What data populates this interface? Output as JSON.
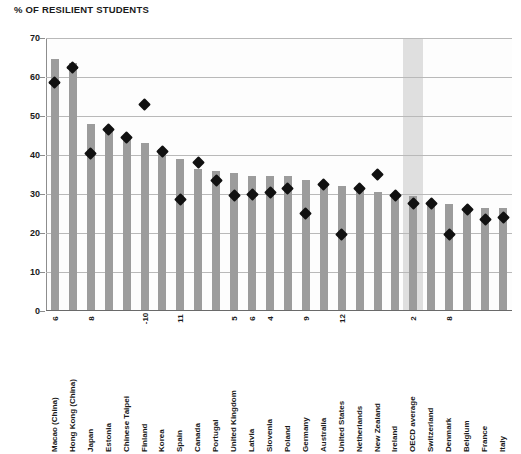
{
  "chart_data": {
    "type": "bar",
    "title": "% OF RESILIENT STUDENTS",
    "xlabel": "",
    "ylabel": "",
    "ylim": [
      0,
      70
    ],
    "ytick_step": 10,
    "yticks": [
      0,
      10,
      20,
      30,
      40,
      50,
      60,
      70
    ],
    "grid": true,
    "legend": "none",
    "highlight_category": "OECD average",
    "categories": [
      "Macao (China)",
      "Hong Kong (China)",
      "Japan",
      "Estonia",
      "Chinese Taipei",
      "Finland",
      "Korea",
      "Spain",
      "Canada",
      "Portugal",
      "United Kingdom",
      "Latvia",
      "Slovenia",
      "Poland",
      "Germany",
      "Australia",
      "United States",
      "Netherlands",
      "New Zealand",
      "Ireland",
      "OECD average",
      "Switzerland",
      "Denmark",
      "Belgium",
      "France",
      "Italy"
    ],
    "series": [
      {
        "name": "bars",
        "marker": "bar",
        "color": "#9c9c9c",
        "values": [
          64.5,
          63.5,
          48.0,
          46.5,
          45.0,
          43.0,
          41.5,
          39.0,
          36.5,
          36.0,
          35.5,
          34.5,
          34.5,
          34.5,
          33.5,
          32.0,
          32.0,
          31.0,
          30.5,
          30.0,
          29.5,
          27.5,
          27.5,
          26.5,
          26.5,
          26.5
        ]
      },
      {
        "name": "markers",
        "marker": "diamond",
        "color": "#111111",
        "values": [
          58.5,
          62.5,
          40.5,
          46.5,
          44.5,
          53.0,
          41.0,
          28.5,
          38.0,
          33.5,
          29.5,
          30.0,
          30.5,
          31.5,
          25.0,
          32.5,
          19.5,
          31.5,
          35.0,
          29.5,
          27.5,
          27.5,
          19.5,
          26.0,
          23.5,
          24.0
        ]
      }
    ],
    "annotations": [
      {
        "category": "Macao (China)",
        "text": "6"
      },
      {
        "category": "Japan",
        "text": "8"
      },
      {
        "category": "Finland",
        "text": "-10"
      },
      {
        "category": "Spain",
        "text": "11"
      },
      {
        "category": "United Kingdom",
        "text": "5"
      },
      {
        "category": "Latvia",
        "text": "6"
      },
      {
        "category": "Slovenia",
        "text": "4"
      },
      {
        "category": "Germany",
        "text": "9"
      },
      {
        "category": "United States",
        "text": "12"
      },
      {
        "category": "OECD average",
        "text": "2"
      },
      {
        "category": "Denmark",
        "text": "8"
      }
    ]
  }
}
